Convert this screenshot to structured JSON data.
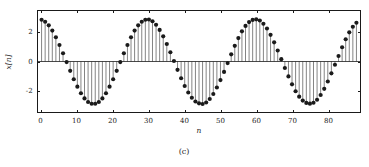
{
  "figure": {
    "caption": "(c)",
    "background": "#ffffff",
    "ink_color": "#1a1a1a"
  },
  "chart_data": {
    "type": "line",
    "render_style": "stem",
    "title": "",
    "subtitle": "",
    "xlabel": "n",
    "ylabel": "x[n]",
    "xlim": [
      -1,
      89
    ],
    "ylim": [
      -3.45,
      3.45
    ],
    "xticks": [
      0,
      10,
      20,
      30,
      40,
      50,
      60,
      70,
      80
    ],
    "xticklabels": [
      "0",
      "10",
      "20",
      "30",
      "40",
      "50",
      "60",
      "70",
      "80"
    ],
    "yticks": [
      -2,
      0,
      2
    ],
    "yticklabels": [
      "-2",
      "0",
      "2"
    ],
    "grid": false,
    "legend": null,
    "annotations": [],
    "marker": "filled-circle",
    "marker_size": 2.1,
    "stem_color": "#1a1a1a",
    "marker_color": "#1a1a1a",
    "baseline": 0,
    "amplitude": 2.9,
    "period": 31,
    "phase_shift_samples": -0.5,
    "x": [
      0,
      1,
      2,
      3,
      4,
      5,
      6,
      7,
      8,
      9,
      10,
      11,
      12,
      13,
      14,
      15,
      16,
      17,
      18,
      19,
      20,
      21,
      22,
      23,
      24,
      25,
      26,
      27,
      28,
      29,
      30,
      31,
      32,
      33,
      34,
      35,
      36,
      37,
      38,
      39,
      40,
      41,
      42,
      43,
      44,
      45,
      46,
      47,
      48,
      49,
      50,
      51,
      52,
      53,
      54,
      55,
      56,
      57,
      58,
      59,
      60,
      61,
      62,
      63,
      64,
      65,
      66,
      67,
      68,
      69,
      70,
      71,
      72,
      73,
      74,
      75,
      76,
      77,
      78,
      79,
      80,
      81,
      82,
      83,
      84,
      85,
      86,
      87,
      88
    ],
    "y": [
      2.85,
      2.72,
      2.47,
      2.11,
      1.66,
      1.13,
      0.56,
      -0.04,
      -0.64,
      -1.21,
      -1.72,
      -2.17,
      -2.52,
      -2.77,
      -2.89,
      -2.89,
      -2.77,
      -2.52,
      -2.17,
      -1.72,
      -1.21,
      -0.64,
      -0.04,
      0.56,
      1.13,
      1.66,
      2.11,
      2.47,
      2.72,
      2.85,
      2.87,
      2.75,
      2.51,
      2.16,
      1.72,
      1.2,
      0.63,
      0.03,
      -0.57,
      -1.14,
      -1.67,
      -2.12,
      -2.48,
      -2.73,
      -2.86,
      -2.9,
      -2.8,
      -2.56,
      -2.22,
      -1.78,
      -1.27,
      -0.71,
      -0.11,
      0.49,
      1.07,
      1.6,
      2.06,
      2.43,
      2.69,
      2.84,
      2.88,
      2.8,
      2.58,
      2.25,
      1.82,
      1.31,
      0.75,
      0.16,
      -0.44,
      -1.02,
      -1.56,
      -2.03,
      -2.4,
      -2.67,
      -2.83,
      -2.88,
      -2.82,
      -2.61,
      -2.29,
      -1.87,
      -1.37,
      -0.81,
      -0.22,
      0.38,
      0.97,
      1.52,
      1.99,
      2.37,
      2.65,
      2.82
    ]
  }
}
